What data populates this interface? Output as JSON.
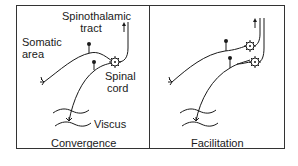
{
  "left_panel": {
    "labels": {
      "tract_line1": "Spinothalamic",
      "tract_line2": "tract",
      "somatic_line1": "Somatic",
      "somatic_line2": "area",
      "spinal_line1": "Spinal",
      "spinal_line2": "cord",
      "viscus": "Viscus"
    },
    "caption": "Convergence"
  },
  "right_panel": {
    "caption": "Facilitation"
  },
  "colors": {
    "line": "#1a1a1a",
    "background": "#ffffff",
    "frame": "#333333"
  }
}
